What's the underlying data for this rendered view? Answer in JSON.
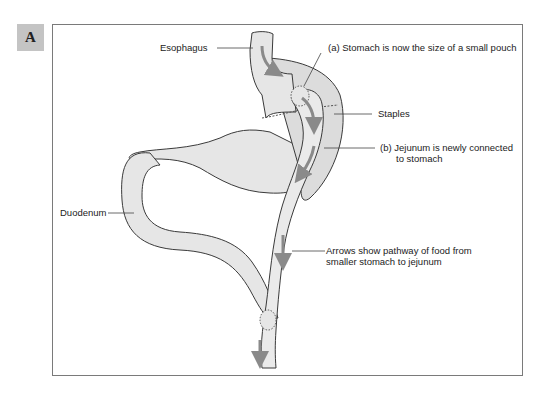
{
  "figure": {
    "panel_label": "A",
    "colors": {
      "organ_fill": "#e6e6e6",
      "organ_shade": "#d2d2d2",
      "outline": "#3a3a3a",
      "arrow": "#8a8a8a",
      "badge": "#c4c4c4",
      "frame": "#7a7a7a"
    },
    "labels": {
      "esophagus": "Esophagus",
      "stomach_pouch": "(a) Stomach is now the size of a small pouch",
      "staples": "Staples",
      "jejunum_line1": "(b) Jejunum is newly connected",
      "jejunum_line2": "to stomach",
      "duodenum": "Duodenum",
      "arrows_line1": "Arrows show pathway of food from",
      "arrows_line2": "smaller stomach to jejunum"
    }
  }
}
